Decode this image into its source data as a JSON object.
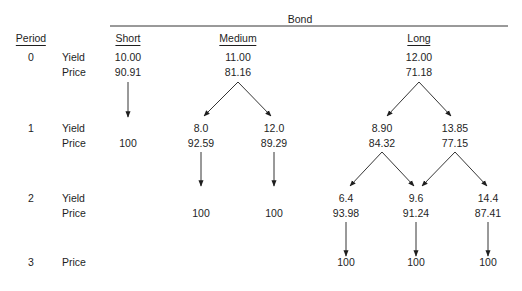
{
  "header": {
    "group_label": "Bond",
    "period_label": "Period",
    "columns": [
      "Short",
      "Medium",
      "Long"
    ]
  },
  "row_labels": {
    "yield": "Yield",
    "price": "Price"
  },
  "periods": [
    "0",
    "1",
    "2",
    "3"
  ],
  "short": {
    "p0": {
      "yield": "10.00",
      "price": "90.91"
    },
    "p1": {
      "price": "100"
    }
  },
  "medium": {
    "p0": {
      "yield": "11.00",
      "price": "81.16"
    },
    "p1_down": {
      "yield": "8.0",
      "price": "92.59"
    },
    "p1_up": {
      "yield": "12.0",
      "price": "89.29"
    },
    "p2_down": {
      "price": "100"
    },
    "p2_up": {
      "price": "100"
    }
  },
  "long": {
    "p0": {
      "yield": "12.00",
      "price": "71.18"
    },
    "p1_down": {
      "yield": "8.90",
      "price": "84.32"
    },
    "p1_up": {
      "yield": "13.85",
      "price": "77.15"
    },
    "p2_low": {
      "yield": "6.4",
      "price": "93.98"
    },
    "p2_mid": {
      "yield": "9.6",
      "price": "91.24"
    },
    "p2_high": {
      "yield": "14.4",
      "price": "87.41"
    },
    "p3_low": {
      "price": "100"
    },
    "p3_mid": {
      "price": "100"
    },
    "p3_high": {
      "price": "100"
    }
  }
}
